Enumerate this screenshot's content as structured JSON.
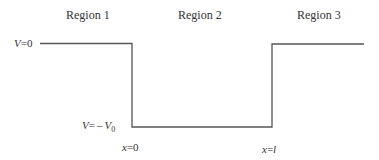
{
  "diagram": {
    "type": "finite-square-well-potential",
    "regions": [
      {
        "label": "Region 1"
      },
      {
        "label": "Region 2"
      },
      {
        "label": "Region 3"
      }
    ],
    "levels": {
      "top": {
        "var": "V",
        "eq": "=",
        "value": "0"
      },
      "bottom": {
        "var": "V",
        "eq": "=",
        "sign": "–",
        "sym": "V",
        "sub": "0"
      }
    },
    "boundaries": [
      {
        "var": "x",
        "eq": "=",
        "value": "0"
      },
      {
        "var": "x",
        "eq": "=",
        "value": "l"
      }
    ],
    "colors": {
      "line": "#555555",
      "text": "#333333",
      "background": "#ffffff"
    }
  }
}
